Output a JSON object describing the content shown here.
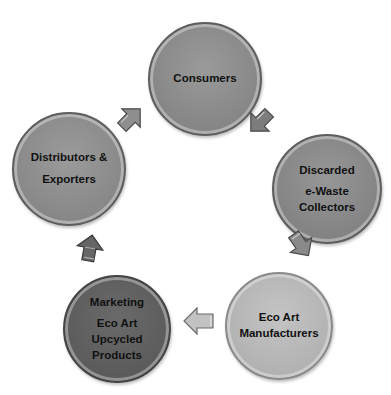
{
  "diagram": {
    "type": "cycle",
    "nodes": [
      {
        "id": "consumers",
        "lines": [
          "Consumers"
        ],
        "color": "#8e8e8e"
      },
      {
        "id": "collectors",
        "lines": [
          "Discarded",
          "e-Waste",
          "Collectors"
        ],
        "color": "#8a8a8a"
      },
      {
        "id": "manufacturers",
        "lines": [
          "Eco Art",
          "Manufacturers"
        ],
        "color": "#b9b9b9"
      },
      {
        "id": "marketing",
        "lines": [
          "Marketing",
          "Eco Art",
          "Upcycled",
          "Products"
        ],
        "color": "#5f5f5f"
      },
      {
        "id": "distributors",
        "lines": [
          "Distributors &",
          "Exporters"
        ],
        "color": "#8f8f8f"
      }
    ],
    "edges": [
      {
        "from": "consumers",
        "to": "collectors"
      },
      {
        "from": "collectors",
        "to": "manufacturers"
      },
      {
        "from": "manufacturers",
        "to": "marketing"
      },
      {
        "from": "marketing",
        "to": "distributors"
      },
      {
        "from": "distributors",
        "to": "consumers"
      }
    ]
  }
}
